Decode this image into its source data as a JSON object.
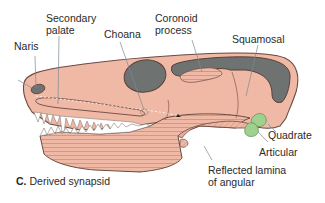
{
  "figure": {
    "caption_letter": "C.",
    "caption_text": "Derived synapsid",
    "colors": {
      "bone": "#f0b9a6",
      "outline": "#6b4a42",
      "fenestra": "#6e7372",
      "jaw_hatch": "#c98f80",
      "quadrate_articular": "#9fd08e",
      "leader_line": "#7a8a94"
    },
    "labels": {
      "naris": "Naris",
      "secondary_palate_1": "Secondary",
      "secondary_palate_2": "palate",
      "choana": "Choana",
      "coronoid_1": "Coronoid",
      "coronoid_2": "process",
      "squamosal": "Squamosal",
      "quadrate": "Quadrate",
      "articular": "Articular",
      "reflected_1": "Reflected lamina",
      "reflected_2": "of angular"
    }
  }
}
